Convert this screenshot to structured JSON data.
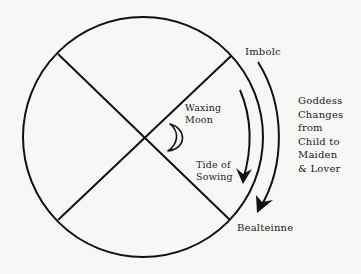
{
  "diagram": {
    "colors": {
      "background": "#f7f7f5",
      "stroke": "#111111",
      "text": "#1a1a1a"
    },
    "labels": {
      "imbolc": "Imbolc",
      "bealteinne": "Bealteinne",
      "waxing_moon": [
        "Waxing",
        "Moon"
      ],
      "tide": [
        "Tide of",
        "Sowing"
      ],
      "goddess": [
        "Goddess",
        "Changes",
        "from",
        "Child to",
        "Maiden",
        "& Lover"
      ]
    },
    "icons": {
      "moon": "crescent-moon-icon"
    }
  }
}
